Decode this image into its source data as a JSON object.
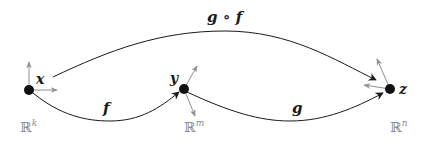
{
  "diagram": {
    "colors": {
      "curve": "#1a1a1a",
      "point": "#111111",
      "tangent": "#8f8f8f",
      "space_label": "#8a8a8a"
    },
    "points": [
      {
        "id": "x",
        "label": "x",
        "space": "ℝ",
        "space_exp": "k"
      },
      {
        "id": "y",
        "label": "y",
        "space": "ℝ",
        "space_exp": "m"
      },
      {
        "id": "z",
        "label": "z",
        "space": "ℝ",
        "space_exp": "n"
      }
    ],
    "maps": [
      {
        "id": "f",
        "label": "f",
        "from": "x",
        "to": "y"
      },
      {
        "id": "g",
        "label": "g",
        "from": "y",
        "to": "z"
      },
      {
        "id": "gof",
        "label": "g ∘ f",
        "from": "x",
        "to": "z"
      }
    ]
  }
}
